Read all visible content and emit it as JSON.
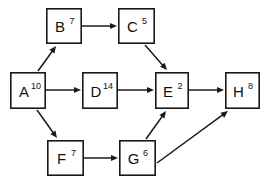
{
  "diagram": {
    "background_color": "#ffffff",
    "stroke_color": "#1a1a1a",
    "text_color": "#111111",
    "nodes": [
      {
        "id": "A",
        "label": "A",
        "weight": "10",
        "x": 10,
        "y": 72,
        "w": 36,
        "h": 37
      },
      {
        "id": "B",
        "label": "B",
        "weight": "7",
        "x": 46,
        "y": 8,
        "w": 36,
        "h": 36
      },
      {
        "id": "C",
        "label": "C",
        "weight": "5",
        "x": 118,
        "y": 8,
        "w": 37,
        "h": 36
      },
      {
        "id": "D",
        "label": "D",
        "weight": "14",
        "x": 82,
        "y": 72,
        "w": 36,
        "h": 37
      },
      {
        "id": "E",
        "label": "E",
        "weight": "2",
        "x": 155,
        "y": 72,
        "w": 34,
        "h": 37
      },
      {
        "id": "F",
        "label": "F",
        "weight": "7",
        "x": 47,
        "y": 140,
        "w": 37,
        "h": 36
      },
      {
        "id": "G",
        "label": "G",
        "weight": "6",
        "x": 119,
        "y": 140,
        "w": 37,
        "h": 36
      },
      {
        "id": "H",
        "label": "H",
        "weight": "8",
        "x": 225,
        "y": 72,
        "w": 35,
        "h": 37
      }
    ],
    "edges": [
      {
        "id": "A-B",
        "from": "A",
        "to": "B",
        "x1": 38,
        "y1": 71,
        "x2": 56,
        "y2": 46
      },
      {
        "id": "A-D",
        "from": "A",
        "to": "D",
        "x1": 46,
        "y1": 90,
        "x2": 81,
        "y2": 90
      },
      {
        "id": "A-F",
        "from": "A",
        "to": "F",
        "x1": 37,
        "y1": 110,
        "x2": 57,
        "y2": 138
      },
      {
        "id": "B-C",
        "from": "B",
        "to": "C",
        "x1": 82,
        "y1": 26,
        "x2": 117,
        "y2": 26
      },
      {
        "id": "C-E",
        "from": "C",
        "to": "E",
        "x1": 145,
        "y1": 45,
        "x2": 167,
        "y2": 70
      },
      {
        "id": "D-E",
        "from": "D",
        "to": "E",
        "x1": 118,
        "y1": 90,
        "x2": 154,
        "y2": 90
      },
      {
        "id": "E-H",
        "from": "E",
        "to": "H",
        "x1": 189,
        "y1": 90,
        "x2": 224,
        "y2": 90
      },
      {
        "id": "F-G",
        "from": "F",
        "to": "G",
        "x1": 84,
        "y1": 158,
        "x2": 118,
        "y2": 158
      },
      {
        "id": "G-E",
        "from": "G",
        "to": "E",
        "x1": 146,
        "y1": 139,
        "x2": 166,
        "y2": 111
      },
      {
        "id": "G-H",
        "from": "G",
        "to": "H",
        "x1": 157,
        "y1": 163,
        "x2": 228,
        "y2": 111
      }
    ]
  }
}
